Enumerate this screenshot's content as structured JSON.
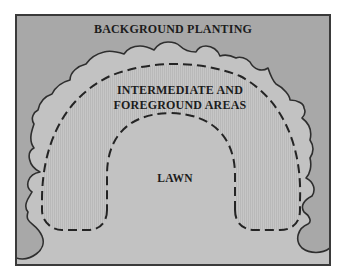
{
  "diagram": {
    "labels": {
      "background": "BACKGROUND PLANTING",
      "intermediate_line1": "INTERMEDIATE AND",
      "intermediate_line2": "FOREGROUND AREAS",
      "lawn": "LAWN"
    },
    "zones": [
      {
        "name": "Background planting",
        "fill": "#a8a8a8",
        "boundary": "scalloped solid line"
      },
      {
        "name": "Intermediate and foreground areas",
        "fill": "#c3c3c3",
        "boundary": "dashed line",
        "texture": "vertical hatching"
      },
      {
        "name": "Lawn",
        "fill": "#bdbdbd",
        "boundary": "dashed line"
      }
    ],
    "colors": {
      "page": "#ffffff",
      "frame_border": "#3a3a3a",
      "background_planting": "#a8a8a8",
      "intermediate": "#c4c4c4",
      "lawn": "#bcbcbc",
      "line": "#2a2a2a"
    }
  }
}
